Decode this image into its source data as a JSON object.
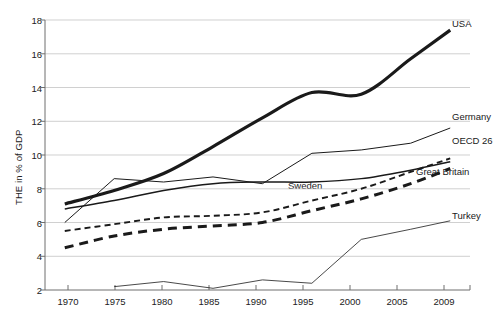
{
  "chart_data": {
    "type": "line",
    "title": "",
    "xlabel": "",
    "ylabel": "THE in % of GDP",
    "xlim": [
      1968,
      2011
    ],
    "ylim": [
      2,
      18
    ],
    "yticks": [
      2,
      4,
      6,
      8,
      10,
      12,
      14,
      16,
      18
    ],
    "xticks": [
      1970,
      1975,
      1980,
      1985,
      1990,
      1995,
      2000,
      2005,
      2009
    ],
    "grid": true,
    "legend_position": "right-annotations",
    "x": [
      1970,
      1975,
      1980,
      1985,
      1990,
      1995,
      2000,
      2005,
      2009
    ],
    "series": [
      {
        "name": "USA",
        "style": "thick-solid",
        "color": "#1a1a1a",
        "values": [
          7.1,
          7.9,
          8.9,
          10.5,
          12.2,
          13.7,
          13.6,
          15.7,
          17.4
        ]
      },
      {
        "name": "Germany",
        "style": "thin-solid",
        "color": "#1a1a1a",
        "values": [
          6.0,
          8.6,
          8.4,
          8.7,
          8.3,
          10.1,
          10.3,
          10.7,
          11.6
        ]
      },
      {
        "name": "OECD 26",
        "style": "medium-solid",
        "color": "#1a1a1a",
        "values": [
          6.8,
          7.3,
          7.9,
          8.3,
          8.4,
          8.4,
          8.6,
          9.1,
          9.6
        ]
      },
      {
        "name": "Great Britain",
        "style": "fine-dashed",
        "color": "#1a1a1a",
        "values": [
          5.5,
          5.9,
          6.3,
          6.4,
          6.6,
          7.3,
          8.0,
          9.0,
          9.8
        ]
      },
      {
        "name": "Sweden",
        "style": "bold-dashed",
        "color": "#1a1a1a",
        "values": [
          4.5,
          5.2,
          5.6,
          5.8,
          6.0,
          6.7,
          7.4,
          8.3,
          9.2
        ]
      },
      {
        "name": "Turkey",
        "style": "hairline-solid",
        "color": "#555555",
        "values": [
          null,
          2.2,
          2.5,
          2.1,
          2.6,
          2.4,
          5.0,
          5.6,
          6.1
        ]
      }
    ],
    "annotations": [
      {
        "text": "USA",
        "x": 2010.2,
        "y": 17.4
      },
      {
        "text": "Germany",
        "x": 2010.2,
        "y": 12.2
      },
      {
        "text": "OECD 26",
        "x": 2010.2,
        "y": 10.8
      },
      {
        "text": "Great Britain",
        "x": 2010.2,
        "y": 9.0
      },
      {
        "text": "Sweden",
        "x": 1996.0,
        "y": 8.3
      },
      {
        "text": "Turkey",
        "x": 2010.2,
        "y": 6.4
      }
    ]
  },
  "axis": {
    "y_title": "THE in % of GDP",
    "y_tick_labels": [
      "18",
      "16",
      "14",
      "12",
      "10",
      "8",
      "6",
      "4",
      "2"
    ],
    "x_tick_labels": [
      "1970",
      "1975",
      "1980",
      "1985",
      "1990",
      "1995",
      "2000",
      "2005",
      "2009"
    ]
  },
  "labels": {
    "usa": "USA",
    "germany": "Germany",
    "oecd": "OECD 26",
    "great_britain": "Great Britain",
    "sweden": "Sweden",
    "turkey": "Turkey"
  }
}
